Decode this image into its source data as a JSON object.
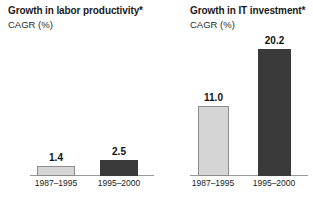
{
  "chart_data": [
    {
      "type": "bar",
      "title": "Growth in labor productivity*",
      "subtitle": "CAGR (%)",
      "xlabel": "",
      "ylabel": "CAGR (%)",
      "categories": [
        "1987–1995",
        "1995–2000"
      ],
      "values": [
        1.4,
        2.5
      ],
      "value_labels": [
        "1.4",
        "2.5"
      ],
      "bar_colors": [
        "#d5d5d5",
        "#3a3a3a"
      ],
      "ylim": [
        0,
        22
      ],
      "grid": false,
      "legend": "none"
    },
    {
      "type": "bar",
      "title": "Growth in IT investment*",
      "subtitle": "CAGR (%)",
      "xlabel": "",
      "ylabel": "CAGR (%)",
      "categories": [
        "1987–1995",
        "1995–2000"
      ],
      "values": [
        11.0,
        20.2
      ],
      "value_labels": [
        "11.0",
        "20.2"
      ],
      "bar_colors": [
        "#d5d5d5",
        "#3a3a3a"
      ],
      "ylim": [
        0,
        22
      ],
      "grid": false,
      "legend": "none"
    }
  ],
  "colors": {
    "background": "#ffffff",
    "light_bar": "#d5d5d5",
    "light_bar_border": "#8d8d8d",
    "dark_bar": "#3a3a3a",
    "axis": "#9a9a9a",
    "text": "#1a1a1a"
  }
}
